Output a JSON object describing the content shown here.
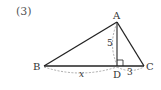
{
  "problem": {
    "number": "(3)"
  },
  "figure": {
    "type": "right-triangle-with-altitude",
    "vertices": {
      "A": {
        "label": "A",
        "x": 117,
        "y": 22
      },
      "B": {
        "label": "B",
        "x": 44,
        "y": 66
      },
      "C": {
        "label": "C",
        "x": 144,
        "y": 66
      },
      "D": {
        "label": "D",
        "x": 117,
        "y": 66
      }
    },
    "measures": {
      "AD": "5",
      "BD": "x",
      "DC": "3"
    },
    "right_angle_at": "D",
    "colors": {
      "line": "#222222",
      "dashed": "#888888",
      "text": "#333333"
    }
  }
}
